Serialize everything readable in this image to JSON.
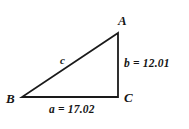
{
  "figure": {
    "background_color": "#ffffff",
    "stroke_color": "#1a1a1a",
    "text_color": "#151515"
  },
  "vertices": [
    {
      "name": "A",
      "label": "A",
      "x": 118,
      "y": 33
    },
    {
      "name": "B",
      "label": "B",
      "x": 22,
      "y": 97
    },
    {
      "name": "C",
      "label": "C",
      "x": 118,
      "y": 97
    }
  ],
  "sides": {
    "a": {
      "label": "a = 17.02",
      "symbol": "a",
      "value": 17.02,
      "between": "B-C"
    },
    "b": {
      "label": "b = 12.01",
      "symbol": "b",
      "value": 12.01,
      "between": "A-C"
    },
    "c": {
      "label": "c",
      "symbol": "c",
      "value": null,
      "between": "A-B"
    }
  },
  "geometry": {
    "polygon_points": "118,33 22,97 118,97",
    "right_angle_at": "C"
  },
  "chart_data": {
    "type": "diagram",
    "vertices": [
      "A",
      "B",
      "C"
    ],
    "edges": [
      {
        "from": "B",
        "to": "C",
        "label": "a = 17.02",
        "length": 17.02
      },
      {
        "from": "A",
        "to": "C",
        "label": "b = 12.01",
        "length": 12.01
      },
      {
        "from": "A",
        "to": "B",
        "label": "c",
        "length": null
      }
    ]
  }
}
